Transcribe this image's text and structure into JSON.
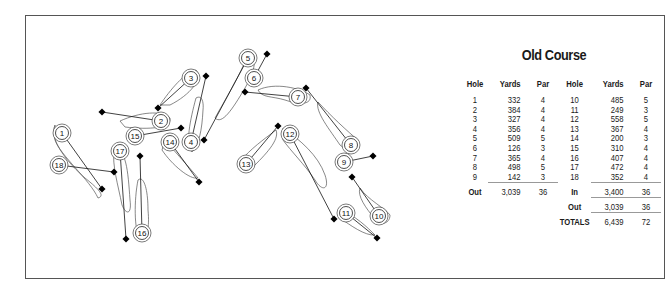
{
  "title": "Old Course",
  "scorecard": {
    "headers": [
      "Hole",
      "Yards",
      "Par",
      "Hole",
      "Yards",
      "Par"
    ],
    "front_nine": [
      {
        "hole": "1",
        "yards": "332",
        "par": "4"
      },
      {
        "hole": "2",
        "yards": "384",
        "par": "4"
      },
      {
        "hole": "3",
        "yards": "327",
        "par": "4"
      },
      {
        "hole": "4",
        "yards": "356",
        "par": "4"
      },
      {
        "hole": "5",
        "yards": "509",
        "par": "5"
      },
      {
        "hole": "6",
        "yards": "126",
        "par": "3"
      },
      {
        "hole": "7",
        "yards": "365",
        "par": "4"
      },
      {
        "hole": "8",
        "yards": "498",
        "par": "5"
      },
      {
        "hole": "9",
        "yards": "142",
        "par": "3"
      }
    ],
    "back_nine": [
      {
        "hole": "10",
        "yards": "485",
        "par": "5"
      },
      {
        "hole": "11",
        "yards": "249",
        "par": "3"
      },
      {
        "hole": "12",
        "yards": "558",
        "par": "5"
      },
      {
        "hole": "13",
        "yards": "367",
        "par": "4"
      },
      {
        "hole": "14",
        "yards": "200",
        "par": "3"
      },
      {
        "hole": "15",
        "yards": "310",
        "par": "4"
      },
      {
        "hole": "16",
        "yards": "407",
        "par": "4"
      },
      {
        "hole": "17",
        "yards": "472",
        "par": "4"
      },
      {
        "hole": "18",
        "yards": "352",
        "par": "4"
      }
    ],
    "out": {
      "label": "Out",
      "yards": "3,039",
      "par": "36"
    },
    "in": {
      "label": "In",
      "yards": "3,400",
      "par": "36"
    },
    "out_repeat": {
      "label": "Out",
      "yards": "3,039",
      "par": "36"
    },
    "totals": {
      "label": "TOTALS",
      "yards": "6,439",
      "par": "72"
    }
  },
  "holes": [
    {
      "n": "1",
      "tee": [
        102,
        189
      ],
      "green": [
        62,
        133
      ],
      "fairway": "M55,125 C48,140 70,165 85,178 C100,190 105,196 98,198 C90,180 60,155 55,140 Z"
    },
    {
      "n": "2",
      "tee": [
        102,
        112
      ],
      "green": [
        161,
        121
      ],
      "fairway": "M120,121 C140,112 162,110 170,118 C172,128 150,130 125,127 Z"
    },
    {
      "n": "3",
      "tee": [
        158,
        108
      ],
      "green": [
        191,
        78
      ],
      "fairway": "M160,105 C170,90 185,72 196,70 C204,78 190,95 170,105 Z"
    },
    {
      "n": "4",
      "tee": [
        206,
        76
      ],
      "green": [
        191,
        142
      ],
      "fairway": "M196,98 C201,95 204,100 203,110 C202,130 199,145 192,152 C185,145 190,120 196,98 Z"
    },
    {
      "n": "5",
      "tee": [
        204,
        140
      ],
      "green": [
        248,
        58
      ],
      "fairway": "M215,118 C225,100 240,75 248,55 C258,52 256,70 245,88 C232,110 222,125 215,118 Z"
    },
    {
      "n": "6",
      "tee": [
        267,
        54
      ],
      "green": [
        254,
        78
      ],
      "fairway": ""
    },
    {
      "n": "7",
      "tee": [
        245,
        92
      ],
      "green": [
        298,
        97
      ],
      "fairway": "M258,90 C275,82 300,88 310,95 C312,105 300,105 285,100 C272,96 262,98 258,90 Z"
    },
    {
      "n": "8",
      "tee": [
        306,
        88
      ],
      "green": [
        351,
        145
      ],
      "fairway": "M318,102 C330,115 348,132 358,140 C360,152 348,152 340,145 C330,130 315,112 318,102 Z"
    },
    {
      "n": "9",
      "tee": [
        373,
        156
      ],
      "green": [
        344,
        162
      ],
      "fairway": ""
    },
    {
      "n": "10",
      "tee": [
        352,
        177
      ],
      "green": [
        379,
        216
      ],
      "fairway": "M360,188 C368,200 385,208 390,215 C390,225 378,226 374,218 C366,208 357,196 360,188 Z"
    },
    {
      "n": "11",
      "tee": [
        377,
        238
      ],
      "green": [
        346,
        213
      ],
      "fairway": "M340,210 C355,215 368,228 375,235 C365,236 350,225 340,218 Z"
    },
    {
      "n": "12",
      "tee": [
        334,
        219
      ],
      "green": [
        290,
        134
      ],
      "fairway": "M283,128 C300,140 318,155 325,175 C330,190 322,192 315,180 C305,165 290,150 283,140 Z"
    },
    {
      "n": "13",
      "tee": [
        278,
        126
      ],
      "green": [
        246,
        164
      ],
      "fairway": "M244,157 C255,145 270,135 276,130 C280,140 265,155 252,168 Z"
    },
    {
      "n": "14",
      "tee": [
        199,
        182
      ],
      "green": [
        170,
        142
      ],
      "fairway": "M165,140 C175,152 190,168 198,178 C190,180 172,165 162,150 Z"
    },
    {
      "n": "15",
      "tee": [
        181,
        128
      ],
      "green": [
        135,
        136
      ],
      "fairway": ""
    },
    {
      "n": "16",
      "tee": [
        140,
        156
      ],
      "green": [
        142,
        233
      ],
      "fairway": "M138,180 C144,175 148,190 148,210 C150,230 146,242 140,240 C134,230 134,200 138,180 Z"
    },
    {
      "n": "17",
      "tee": [
        126,
        239
      ],
      "green": [
        120,
        151
      ],
      "fairway": "M114,150 C126,148 128,170 130,200 C132,215 126,215 122,205 C118,185 112,165 114,150 Z"
    },
    {
      "n": "18",
      "tee": [
        114,
        172
      ],
      "green": [
        59,
        165
      ],
      "fairway": ""
    }
  ]
}
